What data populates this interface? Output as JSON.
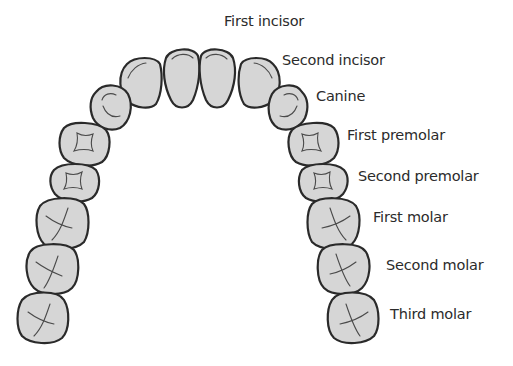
{
  "diagram": {
    "type": "dental-arch",
    "colors": {
      "tooth_fill": "#d6d6d6",
      "tooth_outline": "#2a2a2a",
      "text": "#2b2b2b",
      "background": "#ffffff"
    },
    "labels": [
      {
        "id": "first-incisor",
        "text": "First incisor"
      },
      {
        "id": "second-incisor",
        "text": "Second incisor"
      },
      {
        "id": "canine",
        "text": "Canine"
      },
      {
        "id": "first-premolar",
        "text": "First premolar"
      },
      {
        "id": "second-premolar",
        "text": "Second premolar"
      },
      {
        "id": "first-molar",
        "text": "First molar"
      },
      {
        "id": "second-molar",
        "text": "Second molar"
      },
      {
        "id": "third-molar",
        "text": "Third molar"
      }
    ]
  }
}
